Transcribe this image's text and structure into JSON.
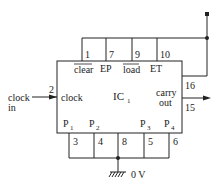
{
  "diagram": {
    "ic_label": "IC",
    "ic_subscript": "1",
    "top_pins": [
      {
        "number": "1",
        "label": "clear",
        "overbar": true
      },
      {
        "number": "7",
        "label": "EP",
        "overbar": false
      },
      {
        "number": "9",
        "label": "load",
        "overbar": true
      },
      {
        "number": "10",
        "label": "ET",
        "overbar": false
      }
    ],
    "left_pin": {
      "number": "2",
      "label": "clock"
    },
    "input_label_line1": "clock",
    "input_label_line2": "in",
    "right_pins": [
      {
        "number": "16",
        "label": ""
      },
      {
        "number": "15",
        "label_line1": "carry",
        "label_line2": "out"
      }
    ],
    "bottom_pins": [
      {
        "number": "3",
        "label": "P",
        "sub": "1"
      },
      {
        "number": "4",
        "label": "P",
        "sub": "2"
      },
      {
        "number": "8",
        "label": "",
        "sub": ""
      },
      {
        "number": "5",
        "label": "P",
        "sub": "3"
      },
      {
        "number": "6",
        "label": "P",
        "sub": "4"
      }
    ],
    "ground_label": "0 V",
    "colors": {
      "line": "#222222",
      "background": "#ffffff"
    }
  }
}
